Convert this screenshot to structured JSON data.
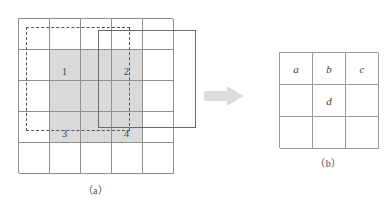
{
  "figure": {
    "background_color": "#ffffff",
    "grid_line_color": "#8f8f8f",
    "shade_color": "#d4d4d4",
    "bold_border_color": "#6b6b6b",
    "dashed_border_color": "#555555",
    "arrow_color": "#d9d9d9"
  },
  "panel_a": {
    "caption": "（a）",
    "rows": 5,
    "columns": 5,
    "shaded_block": {
      "start_row": 2,
      "start_column": 2,
      "rows": 3,
      "columns": 3
    },
    "cell_labels": [
      {
        "id": "1",
        "text": "1",
        "row": 2,
        "column": 2
      },
      {
        "id": "2",
        "text": "2",
        "row": 2,
        "column": 4
      },
      {
        "id": "3",
        "text": "3",
        "row": 4,
        "column": 2
      },
      {
        "id": "4",
        "text": "4",
        "row": 4,
        "column": 4
      }
    ],
    "dashed_window": {
      "label": "dashed-window",
      "style": "dashed"
    },
    "bold_window": {
      "label": "bold-window",
      "style": "solid"
    }
  },
  "arrow": {
    "name": "right-arrow-icon",
    "direction": "right"
  },
  "panel_b": {
    "caption": "（b）",
    "rows": 3,
    "columns": 3,
    "cells": [
      [
        "a",
        "b",
        "c"
      ],
      [
        "",
        "d",
        ""
      ],
      [
        "",
        "",
        ""
      ]
    ]
  }
}
